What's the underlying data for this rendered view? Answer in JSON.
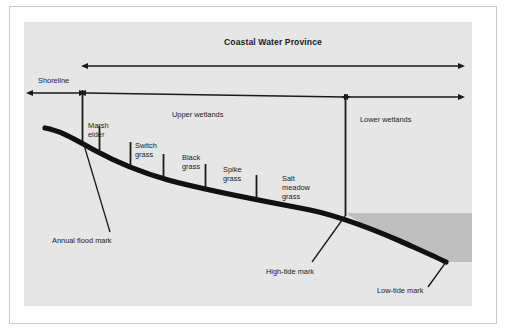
{
  "figure": {
    "title": "Coastal Water Province",
    "background_color": "#e6e6e6",
    "frame_color": "#c9c9c9",
    "line_color": "#1a1a1a",
    "water_color": "#bfbfbf",
    "shore_color": "#111111"
  },
  "zones": {
    "shoreline": "Shoreline",
    "upper_wetlands": "Upper wetlands",
    "lower_wetlands": "Lower wetlands"
  },
  "vegetation": [
    {
      "name": "Marsh elder",
      "line1": "Marsh",
      "line2": "elder",
      "line3": ""
    },
    {
      "name": "Switch grass",
      "line1": "Switch",
      "line2": "grass",
      "line3": ""
    },
    {
      "name": "Black grass",
      "line1": "Black",
      "line2": "grass",
      "line3": ""
    },
    {
      "name": "Spike grass",
      "line1": "Spike",
      "line2": "grass",
      "line3": ""
    },
    {
      "name": "Salt meadow grass",
      "line1": "Salt",
      "line2": "meadow",
      "line3": "grass"
    }
  ],
  "marks": {
    "annual_flood": "Annual flood mark",
    "high_tide": "High-tide mark",
    "low_tide": "Low-tide mark"
  }
}
